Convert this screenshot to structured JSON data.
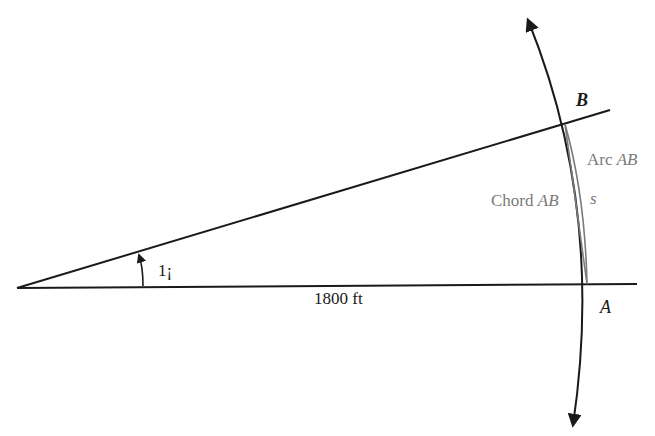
{
  "diagram": {
    "colors": {
      "line": "#1a1a1a",
      "gray": "#7a7a7a",
      "background": "#ffffff"
    },
    "labels": {
      "point_b": "B",
      "point_a": "A",
      "arc": "Arc ",
      "arc_ab": "AB",
      "chord": "Chord ",
      "chord_ab": "AB",
      "arc_length": "s",
      "angle": "1¡",
      "distance": "1800 ft"
    }
  }
}
